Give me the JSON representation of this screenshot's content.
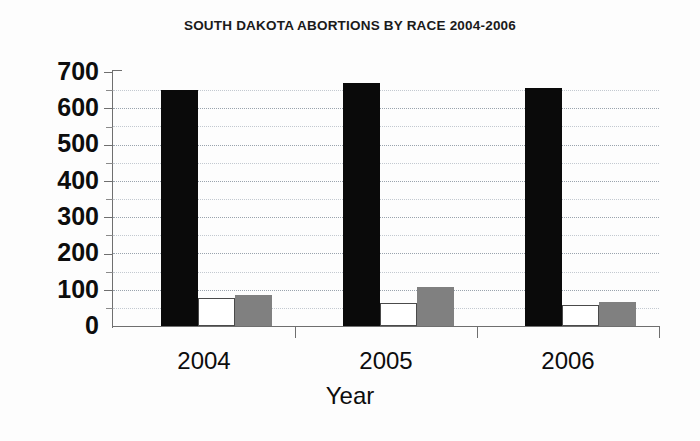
{
  "chart_data": {
    "type": "bar",
    "title": "SOUTH DAKOTA ABORTIONS BY RACE 2004-2006",
    "xlabel": "Year",
    "ylabel": "",
    "categories": [
      "2004",
      "2005",
      "2006"
    ],
    "series": [
      {
        "name": "black-series",
        "color": "#0a0a0a",
        "values": [
          650,
          670,
          655
        ]
      },
      {
        "name": "white-series",
        "color": "#ffffff",
        "values": [
          77,
          63,
          57
        ]
      },
      {
        "name": "gray-series",
        "color": "#808080",
        "values": [
          85,
          107,
          67
        ]
      }
    ],
    "ylim": [
      0,
      700
    ],
    "ytick_labels": [
      "700",
      "600",
      "500",
      "400",
      "300",
      "200",
      "100",
      "0"
    ],
    "ytick_values": [
      700,
      600,
      500,
      400,
      300,
      200,
      100,
      0
    ],
    "yminor_values": [
      650,
      550,
      450,
      350,
      250,
      150,
      50
    ],
    "ytick_step": 100,
    "grid": true,
    "grid_style": "dotted",
    "legend": false,
    "legend_position": "none",
    "axis_color": "#6f6f6f",
    "grid_color": "#9aa3ad",
    "background": "#ffffff"
  },
  "axis": {
    "y_labels": {
      "v700": "700",
      "v600": "600",
      "v500": "500",
      "v400": "400",
      "v300": "300",
      "v200": "200",
      "v100": "100",
      "v0": "0"
    },
    "x_labels": {
      "c0": "2004",
      "c1": "2005",
      "c2": "2006"
    },
    "x_title": "Year"
  }
}
